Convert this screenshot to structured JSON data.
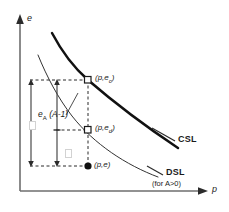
{
  "figure": {
    "axes": {
      "y_label": "e",
      "x_label": "p"
    },
    "points": [
      {
        "id": "upper",
        "label": "(p,e",
        "sub": "c",
        "label_close": ")",
        "marker": "open-square"
      },
      {
        "id": "middle",
        "label": "(p,e",
        "sub": "d",
        "label_close": ")",
        "marker": "open-square"
      },
      {
        "id": "lower",
        "label": "(p,e)",
        "sub": "",
        "label_close": "",
        "marker": "filled-circle"
      }
    ],
    "annotations": {
      "gap_label_main": "e",
      "gap_label_sub": "A",
      "gap_label_expr": "(A-1)"
    },
    "curves": [
      {
        "id": "csl",
        "label": "CSL",
        "sublabel": "",
        "style": "thick"
      },
      {
        "id": "dsl",
        "label": "DSL",
        "sublabel": "(for A>0)",
        "sublabel_italic_part": "A>0",
        "style": "thin"
      }
    ],
    "colors": {
      "ink": "#1a1a1a",
      "curve": "#111111",
      "dashed": "#2b2b2b",
      "axis": "#6e6e6e",
      "tofu": "#d2d2d2"
    }
  }
}
